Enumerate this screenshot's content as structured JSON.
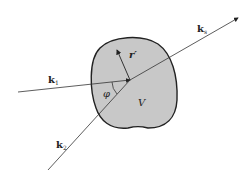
{
  "diagram": {
    "type": "scattering-geometry",
    "labels": {
      "k1": {
        "main": "k",
        "sub": "1"
      },
      "k2": {
        "main": "k",
        "sub": "2"
      },
      "ks": {
        "main": "k",
        "sub": "s"
      },
      "r_prime": "r′",
      "phi": "φ",
      "volume": "V"
    },
    "colors": {
      "region_fill": "#c8c8c8",
      "stroke": "#222222"
    }
  }
}
